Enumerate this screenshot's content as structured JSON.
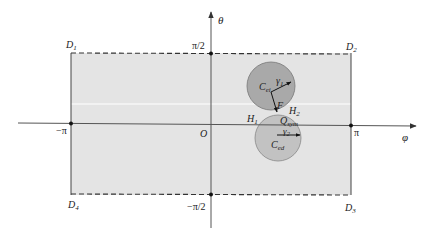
{
  "diagram": {
    "type": "phase-plane-region",
    "axes": {
      "x_label": "φ",
      "y_label": "θ",
      "origin_label": "O",
      "x_ticks": [
        {
          "label": "−π",
          "value": "-pi"
        },
        {
          "label": "π",
          "value": "pi"
        }
      ],
      "y_ticks": [
        {
          "label": "π/2",
          "value": "pi/2"
        },
        {
          "label": "−π/2",
          "value": "-pi/2"
        }
      ]
    },
    "region": {
      "fill": "#e4e4e4",
      "corners": [
        {
          "name": "D",
          "sub": "1",
          "position": "top-left"
        },
        {
          "name": "D",
          "sub": "2",
          "position": "top-right"
        },
        {
          "name": "D",
          "sub": "3",
          "position": "bottom-right"
        },
        {
          "name": "D",
          "sub": "4",
          "position": "bottom-left"
        }
      ],
      "top_edge": "dashed",
      "bottom_edge": "dashed",
      "left_edge": "solid",
      "right_edge": "solid"
    },
    "circles": [
      {
        "id": "upper",
        "center_label": "C",
        "center_sub": "ei",
        "radius_label": "γ",
        "radius_sub": "1",
        "fill": "#a9a9a9"
      },
      {
        "id": "lower",
        "center_label": "C",
        "center_sub": "ed",
        "radius_label": "γ",
        "radius_sub": "2",
        "fill": "#c2c2c2"
      }
    ],
    "points": [
      {
        "name": "F",
        "sub": ""
      },
      {
        "name": "H",
        "sub": "1"
      },
      {
        "name": "H",
        "sub": "2"
      },
      {
        "name": "Q",
        "sub": "sym"
      }
    ],
    "colors": {
      "axis": "#555555",
      "border": "#444444",
      "region": "#e4e4e4",
      "circle_upper": "#a9a9a9",
      "circle_lower": "#c2c2c2"
    }
  }
}
